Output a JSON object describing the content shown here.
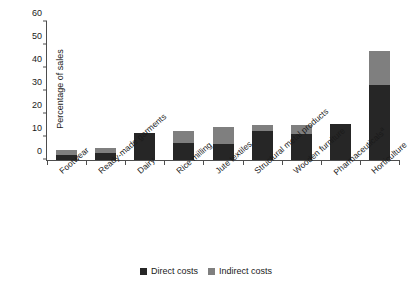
{
  "chart_data": {
    "type": "bar",
    "subtype": "stacked-vertical",
    "title": "",
    "xlabel": "",
    "ylabel": "Percentage of sales",
    "ylim": [
      0,
      60
    ],
    "yticks": [
      0,
      10,
      20,
      30,
      40,
      50,
      60
    ],
    "grid": false,
    "legend_position": "bottom-center",
    "categories": [
      "Footwear",
      "Ready-made garments",
      "Dairy",
      "Rice milling",
      "Jute textiles",
      "Structural metal products",
      "Wooden furniture",
      "Pharmaceuticals",
      "Horticulture"
    ],
    "category_footnote_markers": [
      "",
      "",
      "",
      "",
      "",
      "",
      "",
      "a",
      ""
    ],
    "series": [
      {
        "name": "Direct costs",
        "color": "#262626",
        "values": [
          2.0,
          3.0,
          11.8,
          7.6,
          6.8,
          12.6,
          11.5,
          15.6,
          32.5
        ]
      },
      {
        "name": "Indirect costs",
        "color": "#7f7f7f",
        "values": [
          2.3,
          2.4,
          0.0,
          4.9,
          7.4,
          2.8,
          3.7,
          0.0,
          15.0
        ]
      }
    ],
    "totals": [
      4.3,
      5.4,
      11.8,
      12.5,
      14.2,
      15.4,
      15.2,
      15.6,
      47.5
    ]
  },
  "legend": {
    "items": [
      {
        "label": "Direct costs",
        "color": "#262626"
      },
      {
        "label": "Indirect costs",
        "color": "#7f7f7f"
      }
    ]
  }
}
